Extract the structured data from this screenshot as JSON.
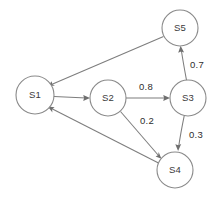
{
  "diagram": {
    "type": "state-transition-diagram",
    "canvas": {
      "width": 222,
      "height": 201,
      "background": "#ffffff"
    },
    "style": {
      "node_stroke": "#8a8a8a",
      "node_fill": "#ffffff",
      "edge_stroke": "#7d7d7d",
      "label_color": "#2e2e2e",
      "node_label_color": "#3a3a3a"
    },
    "nodes": [
      {
        "id": "S1",
        "label": "S1",
        "cx": 35,
        "cy": 95,
        "r": 19
      },
      {
        "id": "S2",
        "label": "S2",
        "cx": 108,
        "cy": 98,
        "r": 18
      },
      {
        "id": "S3",
        "label": "S3",
        "cx": 188,
        "cy": 98,
        "r": 18
      },
      {
        "id": "S4",
        "label": "S4",
        "cx": 175,
        "cy": 170,
        "r": 18
      },
      {
        "id": "S5",
        "label": "S5",
        "cx": 180,
        "cy": 28,
        "r": 18
      }
    ],
    "edges": [
      {
        "id": "e-s1-s2",
        "from": "S1",
        "to": "S2",
        "label": "",
        "label_x": 0,
        "label_y": 0,
        "directed": true
      },
      {
        "id": "e-s2-s3",
        "from": "S2",
        "to": "S3",
        "label": "0.8",
        "label_x": 146,
        "label_y": 87,
        "directed": true
      },
      {
        "id": "e-s3-s5",
        "from": "S3",
        "to": "S5",
        "label": "0.7",
        "label_x": 197,
        "label_y": 65,
        "directed": true
      },
      {
        "id": "e-s3-s4",
        "from": "S3",
        "to": "S4",
        "label": "0.3",
        "label_x": 196,
        "label_y": 135,
        "directed": true
      },
      {
        "id": "e-s2-s4",
        "from": "S2",
        "to": "S4",
        "label": "0.2",
        "label_x": 147,
        "label_y": 121,
        "directed": true
      },
      {
        "id": "e-s5-s1",
        "from": "S5",
        "to": "S1",
        "label": "",
        "label_x": 0,
        "label_y": 0,
        "directed": true
      },
      {
        "id": "e-s4-s1",
        "from": "S4",
        "to": "S1",
        "label": "",
        "label_x": 0,
        "label_y": 0,
        "directed": true
      }
    ]
  }
}
